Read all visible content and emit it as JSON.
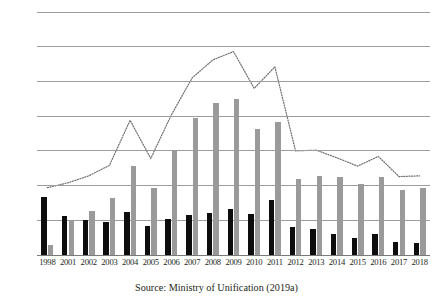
{
  "caption": "Source: Ministry of Unification (2019a)",
  "chart_data": {
    "type": "bar",
    "title": "",
    "xlabel": "",
    "ylabel": "",
    "ylim": [
      0,
      3500
    ],
    "ytick_step": 500,
    "yticks": [
      "0",
      "500",
      "1000",
      "1500",
      "2000",
      "2500",
      "3000",
      "3500"
    ],
    "grid": true,
    "legend_position": "none",
    "categories": [
      "1998",
      "2001",
      "2002",
      "2003",
      "2004",
      "2005",
      "2006",
      "2007",
      "2008",
      "2009",
      "2010",
      "2011",
      "2012",
      "2013",
      "2014",
      "2015",
      "2016",
      "2017",
      "2018"
    ],
    "series": [
      {
        "name": "male",
        "kind": "bar",
        "color": "#0d0d0d",
        "values": [
          830,
          560,
          510,
          475,
          625,
          425,
          515,
          575,
          610,
          660,
          595,
          795,
          400,
          370,
          305,
          250,
          300,
          190,
          170
        ]
      },
      {
        "name": "female",
        "kind": "bar",
        "color": "#9a9a9a",
        "values": [
          140,
          490,
          630,
          815,
          1275,
          960,
          1510,
          1980,
          2195,
          2250,
          1810,
          1910,
          1100,
          1145,
          1120,
          1030,
          1120,
          940,
          970
        ]
      },
      {
        "name": "total",
        "kind": "line",
        "style": "dotted",
        "color": "#6f6f6f",
        "values": [
          970,
          1040,
          1140,
          1290,
          1940,
          1390,
          2020,
          2550,
          2810,
          2930,
          2400,
          2710,
          1500,
          1510,
          1400,
          1280,
          1420,
          1130,
          1140
        ]
      }
    ]
  }
}
